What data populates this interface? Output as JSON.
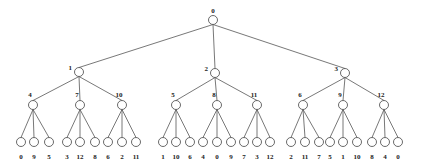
{
  "diagram": {
    "type": "tree",
    "colors": {
      "edge": "#555555",
      "node_stroke": "#444444",
      "node_fill": "#ffffff",
      "text": "#222222"
    },
    "root": {
      "label": "0",
      "x": 213,
      "y": 20,
      "children": [
        {
          "label": "1",
          "x": 79,
          "y": 72,
          "children": [
            {
              "label": "4",
              "x": 33,
              "y": 105,
              "leaves": [
                {
                  "x": 21,
                  "label": "0"
                },
                {
                  "x": 34,
                  "label": "9"
                },
                {
                  "x": 49,
                  "label": "5"
                }
              ]
            },
            {
              "label": "7",
              "x": 80,
              "y": 105,
              "leaves": [
                {
                  "x": 67,
                  "label": "3"
                },
                {
                  "x": 80,
                  "label": "12"
                },
                {
                  "x": 95,
                  "label": "8"
                }
              ]
            },
            {
              "label": "10",
              "x": 122,
              "y": 105,
              "leaves": [
                {
                  "x": 108,
                  "label": "6"
                },
                {
                  "x": 122,
                  "label": "2"
                },
                {
                  "x": 136,
                  "label": "11"
                }
              ]
            }
          ]
        },
        {
          "label": "2",
          "x": 215,
          "y": 73,
          "children": [
            {
              "label": "5",
              "x": 176,
              "y": 105,
              "leaves": [
                {
                  "x": 163,
                  "label": "1"
                },
                {
                  "x": 176,
                  "label": "10"
                },
                {
                  "x": 190,
                  "label": "6"
                }
              ]
            },
            {
              "label": "8",
              "x": 217,
              "y": 105,
              "leaves": [
                {
                  "x": 203,
                  "label": "4"
                },
                {
                  "x": 217,
                  "label": "0"
                },
                {
                  "x": 231,
                  "label": "9"
                }
              ]
            },
            {
              "label": "11",
              "x": 257,
              "y": 105,
              "leaves": [
                {
                  "x": 244,
                  "label": "7"
                },
                {
                  "x": 257,
                  "label": "3"
                },
                {
                  "x": 270,
                  "label": "12"
                }
              ]
            }
          ]
        },
        {
          "label": "3",
          "x": 345,
          "y": 73,
          "children": [
            {
              "label": "6",
              "x": 303,
              "y": 105,
              "leaves": [
                {
                  "x": 291,
                  "label": "2"
                },
                {
                  "x": 305,
                  "label": "11"
                },
                {
                  "x": 319,
                  "label": "7"
                }
              ]
            },
            {
              "label": "9",
              "x": 343,
              "y": 105,
              "leaves": [
                {
                  "x": 330,
                  "label": "5"
                },
                {
                  "x": 343,
                  "label": "1"
                },
                {
                  "x": 357,
                  "label": "10"
                }
              ]
            },
            {
              "label": "12",
              "x": 384,
              "y": 105,
              "leaves": [
                {
                  "x": 372,
                  "label": "8"
                },
                {
                  "x": 385,
                  "label": "4"
                },
                {
                  "x": 398,
                  "label": "0"
                }
              ]
            }
          ]
        }
      ]
    },
    "leaf_y": 142,
    "leaf_label_y": 159,
    "node_radius": 4.5
  }
}
